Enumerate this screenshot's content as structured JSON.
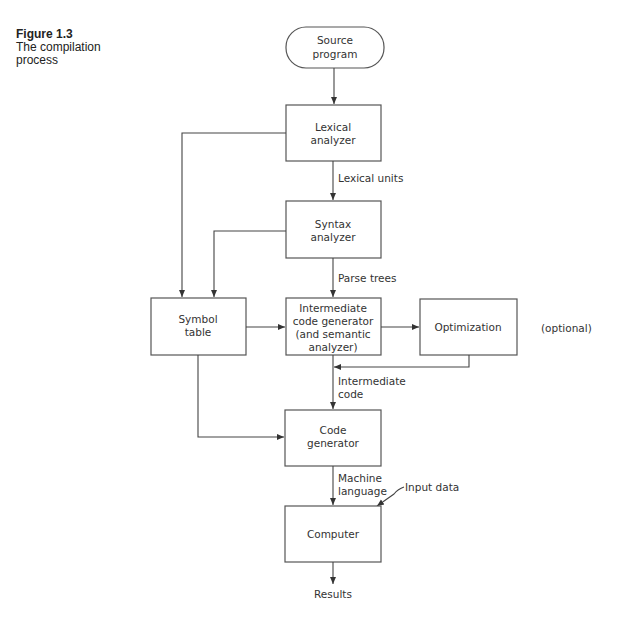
{
  "caption": {
    "number": "Figure 1.3",
    "title_line1": "The compilation",
    "title_line2": "process"
  },
  "nodes": {
    "source": {
      "line1": "Source",
      "line2": "program"
    },
    "lexical": {
      "line1": "Lexical",
      "line2": "analyzer"
    },
    "syntax": {
      "line1": "Syntax",
      "line2": "analyzer"
    },
    "symbol": {
      "line1": "Symbol",
      "line2": "table"
    },
    "intermediate": {
      "line1": "Intermediate",
      "line2": "code generator",
      "line3": "(and semantic",
      "line4": "analyzer)"
    },
    "optimization": {
      "line1": "Optimization"
    },
    "codegen": {
      "line1": "Code",
      "line2": "generator"
    },
    "computer": {
      "line1": "Computer"
    }
  },
  "edge_labels": {
    "lexical_units": "Lexical units",
    "parse_trees": "Parse trees",
    "intermediate_code_1": "Intermediate",
    "intermediate_code_2": "code",
    "machine_language_1": "Machine",
    "machine_language_2": "language",
    "input_data": "Input data",
    "results": "Results",
    "optional": "(optional)"
  }
}
